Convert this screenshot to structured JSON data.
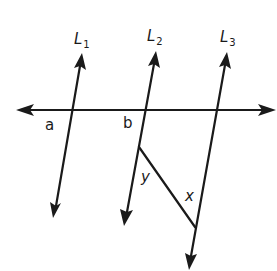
{
  "diagram": {
    "type": "geometry-parallel-lines",
    "stroke_color": "#1a1a1a",
    "background": "#ffffff",
    "lines": [
      {
        "id": "L1",
        "label": "L",
        "subscript": "1"
      },
      {
        "id": "L2",
        "label": "L",
        "subscript": "2"
      },
      {
        "id": "L3",
        "label": "L",
        "subscript": "3"
      }
    ],
    "angle_labels": {
      "a": "a",
      "b": "b",
      "y": "y",
      "x": "x"
    }
  }
}
